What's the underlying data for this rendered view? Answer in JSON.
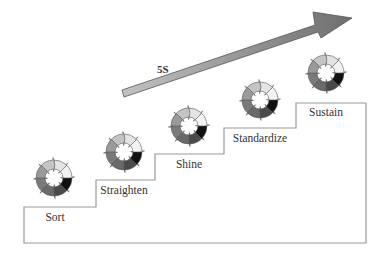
{
  "diagram": {
    "title_label": "5S",
    "steps": [
      {
        "label": "Sort"
      },
      {
        "label": "Straighten"
      },
      {
        "label": "Shine"
      },
      {
        "label": "Standardize"
      },
      {
        "label": "Sustain"
      }
    ],
    "arrow": {
      "color": "#8a8a8a",
      "direction": "up-right"
    },
    "cycle_icon": {
      "segments": 8,
      "segment_colors": [
        "#e4e4e4",
        "#f2f2f2",
        "#111111",
        "#4a4a4a",
        "#6a6a6a",
        "#7a7a7a",
        "#9a9a9a",
        "#c4c4c4"
      ]
    },
    "staircase_color": "#9a9a9a"
  }
}
